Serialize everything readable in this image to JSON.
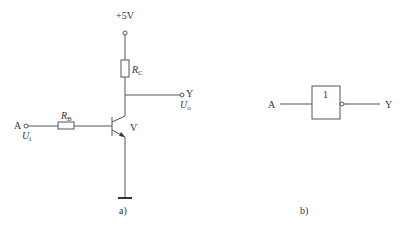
{
  "figure_a": {
    "caption": "a)",
    "supply_label": "+5V",
    "rc_label_main": "R",
    "rc_label_sub": "C",
    "rb_label_main": "R",
    "rb_label_sub": "B",
    "transistor_label": "V",
    "input_label": "A",
    "input_voltage_main": "U",
    "input_voltage_sub": "i",
    "output_label": "Y",
    "output_voltage_main": "U",
    "output_voltage_sub": "o"
  },
  "figure_b": {
    "caption": "b)",
    "input_label": "A",
    "gate_symbol": "1",
    "output_label": "Y"
  }
}
